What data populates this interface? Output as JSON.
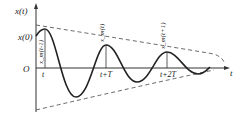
{
  "diagram": {
    "type": "damped-oscillation",
    "y_axis_label": "x(t)",
    "x_axis_label": "t",
    "origin_label": "O",
    "initial_value_label": "x(0)",
    "ticks": [
      "t",
      "t+T",
      "t+2T"
    ],
    "peak_labels": [
      "x_m(t-1)",
      "x_m(t)",
      "x_m(t+1)"
    ],
    "colors": {
      "curve": "#222222",
      "envelope": "#555555",
      "axis": "#333333"
    }
  }
}
